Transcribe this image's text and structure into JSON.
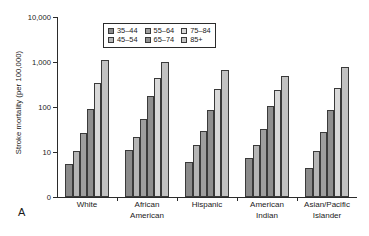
{
  "panel": {
    "letter": "A"
  },
  "chart_data": {
    "type": "bar",
    "title": "",
    "xlabel": "",
    "ylabel": "Stroke mortality (per 100,000)",
    "yscale": "log",
    "ylim": [
      3,
      10000
    ],
    "ytick_labels": [
      "0",
      "10",
      "100",
      "1,000",
      "10,000"
    ],
    "ytick_values": [
      0,
      10,
      100,
      1000,
      10000
    ],
    "grid": false,
    "legend_position": "top-center",
    "categories": [
      "White",
      "African American",
      "Hispanic",
      "American Indian",
      "Asian/Pacific Islander"
    ],
    "category_lines": [
      [
        "White"
      ],
      [
        "African",
        "American"
      ],
      [
        "Hispanic"
      ],
      [
        "American",
        "Indian"
      ],
      [
        "Asian/Pacific",
        "Islander"
      ]
    ],
    "series": [
      {
        "name": "35–44",
        "color": "#8a8a8a",
        "values": [
          5.5,
          11,
          6,
          7.5,
          4.5
        ]
      },
      {
        "name": "45–54",
        "color": "#b5b5b5",
        "values": [
          10.5,
          22,
          14,
          14,
          10.5
        ]
      },
      {
        "name": "55–64",
        "color": "#9e9e9e",
        "values": [
          27,
          55,
          30,
          33,
          28
        ]
      },
      {
        "name": "65–74",
        "color": "#8f8f8f",
        "values": [
          92,
          180,
          87,
          105,
          85
        ]
      },
      {
        "name": "75–84",
        "color": "#d8d8d8",
        "values": [
          340,
          440,
          250,
          235,
          260
        ]
      },
      {
        "name": "85+",
        "color": "#c2c2c2",
        "values": [
          1100,
          1000,
          670,
          500,
          760
        ]
      }
    ]
  }
}
